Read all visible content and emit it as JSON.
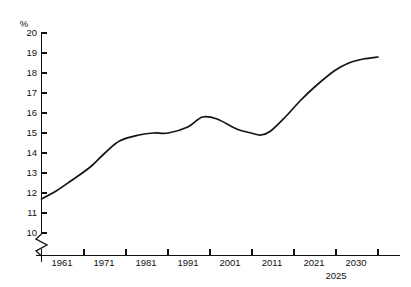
{
  "chart_data": {
    "type": "line",
    "title": "",
    "subtitle": "",
    "xlabel": "",
    "ylabel": "%",
    "unit_label": "%",
    "grid": false,
    "legend": null,
    "legend_position": "none",
    "xlim": [
      1961,
      2030
    ],
    "ylim": [
      10,
      20
    ],
    "y_axis_break": true,
    "y_axis_break_note": "zigzag break on vertical axis below 10",
    "yticks": [
      10,
      11,
      12,
      13,
      14,
      15,
      16,
      17,
      18,
      19,
      20
    ],
    "ytick_labels": [
      "10",
      "11",
      "12",
      "13",
      "14",
      "15",
      "16",
      "17",
      "18",
      "19",
      "20"
    ],
    "xticks": [
      1961,
      1971,
      1981,
      1991,
      2001,
      2011,
      2021,
      2025,
      2030
    ],
    "xtick_labels": [
      "1961",
      "1971",
      "1981",
      "1991",
      "2001",
      "2011",
      "2021",
      "2030"
    ],
    "xtick_label_secondary": "2025",
    "annotations": [
      "2025"
    ],
    "series": [
      {
        "name": "share",
        "color": "#141414",
        "x": [
          1961,
          1964,
          1967,
          1971,
          1974,
          1977,
          1981,
          1984,
          1987,
          1991,
          1994,
          1997,
          2001,
          2004,
          2006,
          2008,
          2011,
          2014,
          2017,
          2021,
          2024,
          2027,
          2030
        ],
        "values": [
          11.7,
          12.1,
          12.6,
          13.3,
          14.0,
          14.6,
          14.9,
          15.0,
          15.0,
          15.3,
          15.8,
          15.7,
          15.2,
          15.0,
          14.9,
          15.1,
          15.8,
          16.6,
          17.3,
          18.1,
          18.5,
          18.7,
          18.8
        ]
      }
    ]
  },
  "axis": {
    "y_unit": "%",
    "x_years": [
      "1961",
      "1971",
      "1981",
      "1991",
      "2001",
      "2011",
      "2021",
      "2030"
    ],
    "x_extra_year": "2025"
  }
}
